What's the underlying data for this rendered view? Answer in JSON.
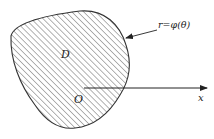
{
  "diagram": {
    "region_label": "D",
    "origin_label": "O",
    "axis_label": "x",
    "curve_label": "r=φ(θ)",
    "colors": {
      "stroke": "#333333",
      "hatch": "#555555",
      "background": "#ffffff"
    }
  }
}
